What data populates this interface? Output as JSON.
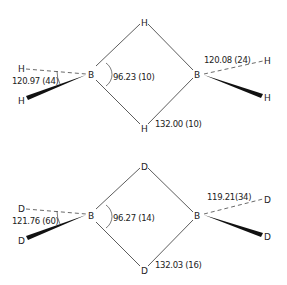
{
  "molecules": [
    {
      "name": "B2H6",
      "atoms": {
        "left_boron": "B",
        "right_boron": "B",
        "bridge_top": "H",
        "bridge_bottom": "H",
        "left_terminal_dashed": "H",
        "left_terminal_wedge": "H",
        "right_terminal_dashed": "H",
        "right_terminal_wedge": "H"
      },
      "labels": {
        "left_terminal_angle": "120.97 (44)",
        "bridge_angle": "96.23 (10)",
        "right_terminal_angle": "120.08 (24)",
        "bridge_angle_b_h_b": "132.00 (10)"
      }
    },
    {
      "name": "B2D6",
      "atoms": {
        "left_boron": "B",
        "right_boron": "B",
        "bridge_top": "D",
        "bridge_bottom": "D",
        "left_terminal_dashed": "D",
        "left_terminal_wedge": "D",
        "right_terminal_dashed": "D",
        "right_terminal_wedge": "D"
      },
      "labels": {
        "left_terminal_angle": "121.76 (60)",
        "bridge_angle": "96.27 (14)",
        "right_terminal_angle": "119.21(34)",
        "bridge_angle_b_h_b": "132.03 (16)"
      }
    }
  ]
}
